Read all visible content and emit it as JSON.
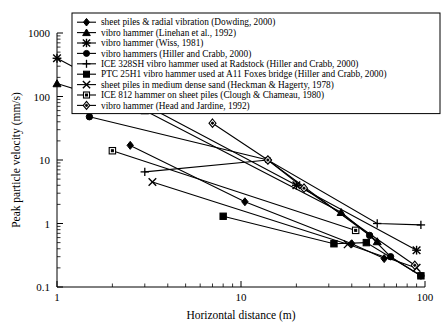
{
  "chart_data": {
    "type": "line",
    "title": "",
    "xlabel": "Horizontal distance (m)",
    "ylabel": "Peak particle velocity (mm/s)",
    "xscale": "log",
    "yscale": "log",
    "xlim": [
      1,
      100
    ],
    "ylim": [
      0.1,
      1000
    ],
    "xticks": [
      1,
      10,
      100
    ],
    "xticklabels": [
      "1",
      "10",
      "100"
    ],
    "yticks": [
      0.1,
      1,
      10,
      100,
      1000
    ],
    "yticklabels": [
      "0.1",
      "1",
      "10",
      "100",
      "1000"
    ],
    "grid": false,
    "legend_position": "upper center",
    "series": [
      {
        "name": "sheet piles & radial vibration (Dowding, 2000)",
        "marker": "filled-diamond",
        "points": [
          [
            2.5,
            17
          ],
          [
            10.5,
            2.2
          ],
          [
            40,
            0.48
          ],
          [
            60,
            0.28
          ]
        ]
      },
      {
        "name": "vibro hammer (Linehan et al., 1992)",
        "marker": "filled-triangle",
        "points": [
          [
            1.0,
            160
          ],
          [
            3.0,
            60
          ],
          [
            35,
            1.5
          ],
          [
            55,
            0.52
          ]
        ]
      },
      {
        "name": "vibro hammer (Wiss, 1981)",
        "marker": "filled-star",
        "points": [
          [
            1.0,
            400
          ],
          [
            20,
            4.0
          ],
          [
            90,
            0.38
          ]
        ]
      },
      {
        "name": "vibro hammers (Hiller and Crabb, 2000)",
        "marker": "filled-circle",
        "points": [
          [
            1.5,
            48
          ],
          [
            14,
            10
          ],
          [
            50,
            0.65
          ],
          [
            65,
            0.3
          ],
          [
            95,
            0.15
          ]
        ]
      },
      {
        "name": "ICE 328SH vibro hammer used at Radstock (Hiller and Crabb, 2000)",
        "marker": "plus",
        "points": [
          [
            3.0,
            6.5
          ],
          [
            14,
            10
          ],
          [
            55,
            1.0
          ],
          [
            95,
            0.95
          ]
        ]
      },
      {
        "name": "PTC 25H1 vibro hammer used at A11 Foxes bridge (Hiller and Crabb, 2000)",
        "marker": "filled-square",
        "points": [
          [
            8.0,
            1.3
          ],
          [
            32,
            0.48
          ],
          [
            48,
            0.5
          ],
          [
            95,
            0.15
          ]
        ]
      },
      {
        "name": "sheet piles in medium dense sand (Heckman & Hagerty, 1978)",
        "marker": "x-cross",
        "points": [
          [
            3.3,
            4.5
          ],
          [
            38,
            0.47
          ],
          [
            90,
            0.2
          ]
        ]
      },
      {
        "name": "ICE 812 hammer on sheet piles (Clough & Chameau, 1980)",
        "marker": "open-square",
        "points": [
          [
            2.0,
            14
          ],
          [
            42,
            0.78
          ]
        ]
      },
      {
        "name": "vibro hammer (Head and Jardine, 1992)",
        "marker": "open-diamond",
        "points": [
          [
            7.0,
            38
          ],
          [
            14,
            10
          ],
          [
            22,
            3.6
          ],
          [
            88,
            0.22
          ]
        ]
      }
    ]
  },
  "legend": {
    "items": [
      "sheet piles & radial vibration (Dowding, 2000)",
      "vibro hammer (Linehan et al., 1992)",
      "vibro hammer (Wiss, 1981)",
      "vibro hammers (Hiller and Crabb, 2000)",
      "ICE 328SH vibro hammer used at Radstock (Hiller and Crabb, 2000)",
      "PTC 25H1 vibro hammer used at A11 Foxes bridge (Hiller and Crabb, 2000)",
      "sheet piles in medium dense sand (Heckman & Hagerty, 1978)",
      "ICE 812 hammer on sheet piles (Clough & Chameau, 1980)",
      "vibro hammer (Head and Jardine, 1992)"
    ]
  },
  "axes": {
    "x_title": "Horizontal distance (m)",
    "y_title": "Peak particle velocity (mm/s)",
    "x_labels": [
      "1",
      "10",
      "100"
    ],
    "y_labels": [
      "1000",
      "100",
      "10",
      "1",
      "0.1"
    ]
  }
}
